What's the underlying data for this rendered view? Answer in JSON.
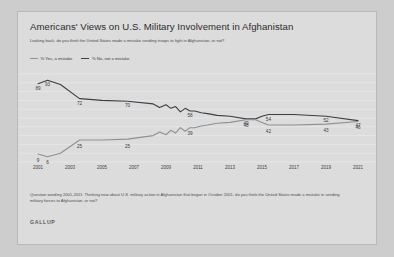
{
  "card": {
    "title": "Americans' Views on U.S. Military Involvement in Afghanistan",
    "subtitle": "Looking back, do you think the United States made a mistake sending troops to fight in Afghanistan, or not?",
    "footnote": "Question wording 2001-2011: Thinking now about U.S. military action in Afghanistan that began in October 2001, do you think the United States made a mistake in sending military forces to Afghanistan, or not?",
    "brand": "GALLUP"
  },
  "colors": {
    "series_no": "#3d3f44",
    "series_yes": "#8d9094",
    "card_bg": "#dcdcdc",
    "page_bg": "#cdcdcd",
    "gridline": "#e9e9e9",
    "text": "#3b3b3b"
  },
  "chart_data": {
    "type": "line",
    "title": "Americans' Views on U.S. Military Involvement in Afghanistan",
    "xlabel": "",
    "ylabel": "",
    "xlim": [
      2001,
      2021
    ],
    "ylim": [
      0,
      100
    ],
    "grid": true,
    "legend_position": "top-left",
    "tick_labels": [
      "2001",
      "2003",
      "2005",
      "2007",
      "2009",
      "2011",
      "2013",
      "2015",
      "2017",
      "2019",
      "2021"
    ],
    "series": [
      {
        "name": "% No, not a mistake",
        "color": "#3d3f44",
        "x": [
          2001.0,
          2001.6,
          2002.4,
          2003.6,
          2005.0,
          2006.6,
          2008.2,
          2008.6,
          2009.0,
          2009.3,
          2009.6,
          2009.9,
          2010.2,
          2010.5,
          2010.8,
          2011.2,
          2011.6,
          2012.2,
          2013.0,
          2014.0,
          2014.6,
          2015.0,
          2015.4,
          2017.0,
          2019.0,
          2021.0
        ],
        "y": [
          89,
          93,
          88,
          72,
          70,
          69,
          66,
          62,
          65,
          61,
          63,
          57,
          61,
          58,
          58,
          56,
          55,
          53,
          52,
          49,
          49,
          52,
          54,
          54,
          52,
          47
        ],
        "labels": [
          {
            "x": 2001.0,
            "y": 89,
            "text": "89"
          },
          {
            "x": 2001.6,
            "y": 93,
            "text": "93"
          },
          {
            "x": 2003.6,
            "y": 72,
            "text": "72"
          },
          {
            "x": 2006.6,
            "y": 70,
            "text": "70"
          },
          {
            "x": 2010.5,
            "y": 58,
            "text": "58"
          },
          {
            "x": 2014.0,
            "y": 49,
            "text": "49"
          },
          {
            "x": 2015.4,
            "y": 54,
            "text": "54"
          },
          {
            "x": 2019.0,
            "y": 52,
            "text": "52"
          },
          {
            "x": 2021.0,
            "y": 47,
            "text": "47"
          }
        ]
      },
      {
        "name": "% Yes, a mistake",
        "color": "#8d9094",
        "x": [
          2001.0,
          2001.6,
          2002.4,
          2003.6,
          2005.0,
          2006.6,
          2008.2,
          2008.6,
          2009.0,
          2009.3,
          2009.6,
          2009.9,
          2010.2,
          2010.5,
          2010.8,
          2011.2,
          2011.6,
          2012.2,
          2013.0,
          2014.0,
          2014.6,
          2015.0,
          2015.4,
          2017.0,
          2019.0,
          2021.0
        ],
        "y": [
          9,
          6,
          10,
          25,
          25,
          26,
          30,
          34,
          31,
          36,
          33,
          39,
          35,
          39,
          39,
          41,
          42,
          44,
          45,
          48,
          48,
          45,
          42,
          42,
          43,
          46
        ],
        "labels": [
          {
            "x": 2001.0,
            "y": 9,
            "text": "9"
          },
          {
            "x": 2001.6,
            "y": 6,
            "text": "6"
          },
          {
            "x": 2003.6,
            "y": 25,
            "text": "25"
          },
          {
            "x": 2006.6,
            "y": 25,
            "text": "25"
          },
          {
            "x": 2010.5,
            "y": 39,
            "text": "39"
          },
          {
            "x": 2014.0,
            "y": 48,
            "text": "48"
          },
          {
            "x": 2015.4,
            "y": 42,
            "text": "42"
          },
          {
            "x": 2019.0,
            "y": 43,
            "text": "43"
          },
          {
            "x": 2021.0,
            "y": 46,
            "text": "46"
          }
        ]
      }
    ]
  }
}
